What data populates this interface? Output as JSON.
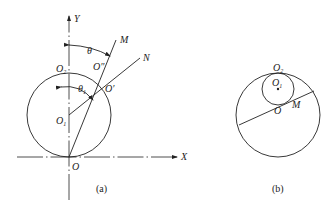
{
  "figure": {
    "panels": [
      {
        "id": "a",
        "caption": "(a)",
        "axes": {
          "x_label": "X",
          "y_label": "Y"
        },
        "points": {
          "origin": "O",
          "center": "O",
          "center_sub": "1",
          "top": "O",
          "top_sub": "2",
          "o_prime": "O′",
          "o_double_prime": "O″",
          "m": "M",
          "n": "N"
        },
        "angles": {
          "theta": "θ",
          "theta1": "θ",
          "theta1_sub": "1"
        }
      },
      {
        "id": "b",
        "caption": "(b)",
        "points": {
          "top": "O",
          "top_sub": "2",
          "center": "O",
          "center_sub": "1",
          "origin": "O",
          "m": "M"
        }
      }
    ]
  }
}
